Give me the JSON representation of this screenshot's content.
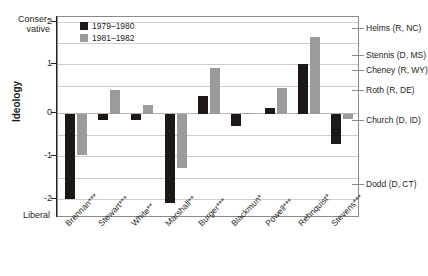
{
  "axis": {
    "y_title": "Ideology",
    "pole_top": "Conser-\nvative",
    "pole_top_line1": "Conser-",
    "pole_top_line2": "vative",
    "pole_bottom": "Liberal",
    "y_ticks": [
      "2",
      "1",
      "0",
      "-1",
      "-2"
    ],
    "ylim": [
      -2.35,
      2.25
    ],
    "grid": true
  },
  "legend": {
    "position": "top-left-inside",
    "entries": [
      {
        "label": "1979–1980",
        "color": "#1d1815",
        "key": "black"
      },
      {
        "label": "1981–1982",
        "color": "#9b9b99",
        "key": "gray"
      }
    ]
  },
  "annotations": [
    {
      "label": "Helms (R, NC)",
      "value": 2.0
    },
    {
      "label": "Stennis (D, MS)",
      "value": 1.37
    },
    {
      "label": "Cheney (R, WY)",
      "value": 1.02
    },
    {
      "label": "Roth (R, DE)",
      "value": 0.57
    },
    {
      "label": "Church (D, ID)",
      "value": -0.13
    },
    {
      "label": "Dodd (D, CT)",
      "value": -1.62
    }
  ],
  "chart_data": {
    "type": "bar",
    "title": "",
    "xlabel": "",
    "ylabel": "Ideology",
    "ylim": [
      -2.35,
      2.25
    ],
    "yticks": [
      2,
      1,
      0,
      -1,
      -2
    ],
    "grid": true,
    "legend_position": "inside top-left",
    "categories": [
      "Brennan***",
      "Stewart***",
      "White**",
      "Marshall**",
      "Burger***",
      "Blackmun*",
      "Powell***",
      "Rehnquist*",
      "Stevens***"
    ],
    "series": [
      {
        "name": "1979–1980",
        "color": "#1d1815",
        "values": [
          -1.95,
          -0.13,
          -0.14,
          -2.05,
          0.42,
          -0.26,
          0.15,
          1.17,
          -0.68
        ]
      },
      {
        "name": "1981–1982",
        "color": "#9b9b99",
        "values": [
          -0.95,
          0.56,
          0.21,
          -1.25,
          1.08,
          0.02,
          0.62,
          1.78,
          -0.1
        ]
      }
    ]
  }
}
